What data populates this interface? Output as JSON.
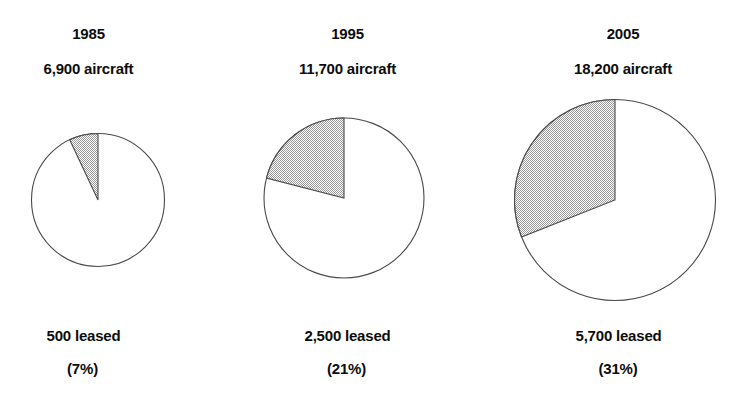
{
  "chart_data": {
    "type": "pie",
    "title": "",
    "subtitle": "",
    "xlabel": "",
    "ylabel": "",
    "legend_position": "none",
    "grid": false,
    "slice_start_angle_deg": 90,
    "slice_direction": "counter-clockwise",
    "colors": {
      "leased_fill": "#c9c9c9",
      "owned_fill": "#ffffff",
      "outline": "#4a4a4a",
      "text": "#0d0d0d"
    },
    "unit": "aircraft",
    "panels": [
      {
        "year": "1985",
        "total_label": "6,900 aircraft",
        "total_value": 6900,
        "leased_label": "500 leased",
        "leased_value": 500,
        "percent_label": "(7%)",
        "percent_value": 7,
        "owned_value": 6400,
        "slices": [
          {
            "name": "leased",
            "value": 7
          },
          {
            "name": "owned",
            "value": 93
          }
        ],
        "radius_px": 66.5,
        "center_x": 98,
        "center_y": 200
      },
      {
        "year": "1995",
        "total_label": "11,700 aircraft",
        "total_value": 11700,
        "leased_label": "2,500 leased",
        "leased_value": 2500,
        "percent_label": "(21%)",
        "percent_value": 21,
        "owned_value": 9200,
        "slices": [
          {
            "name": "leased",
            "value": 21
          },
          {
            "name": "owned",
            "value": 79
          }
        ],
        "radius_px": 80,
        "center_x": 344,
        "center_y": 198
      },
      {
        "year": "2005",
        "total_label": "18,200 aircraft",
        "total_value": 18200,
        "leased_label": "5,700 leased",
        "leased_value": 5700,
        "percent_label": "(31%)",
        "percent_value": 31,
        "owned_value": 12500,
        "slices": [
          {
            "name": "leased",
            "value": 31
          },
          {
            "name": "owned",
            "value": 69
          }
        ],
        "radius_px": 100.5,
        "center_x": 615,
        "center_y": 200
      }
    ]
  },
  "panel_1": {
    "year": "1985",
    "total": "6,900 aircraft",
    "leased": "500 leased",
    "percent": "(7%)"
  },
  "panel_2": {
    "year": "1995",
    "total": "11,700 aircraft",
    "leased": "2,500 leased",
    "percent": "(21%)"
  },
  "panel_3": {
    "year": "2005",
    "total": "18,200 aircraft",
    "leased": "5,700 leased",
    "percent": "(31%)"
  }
}
